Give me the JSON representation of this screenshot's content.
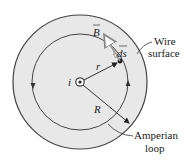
{
  "diagram": {
    "colors": {
      "wire_fill": "#e6e6e6",
      "outline": "#444444",
      "vector_B": "#9a9a9a",
      "background": "#ffffff"
    },
    "center": {
      "x": 80,
      "y": 82
    },
    "wire_radius_px": 67,
    "amperian_radius_px": 48,
    "labels": {
      "current": "i",
      "radius_small": "r",
      "radius_large": "R",
      "field_vector": "B",
      "path_element": "ds",
      "wire_surface_line1": "Wire",
      "wire_surface_line2": "surface",
      "amperian_line1": "Amperian",
      "amperian_line2": "loop"
    },
    "loop_direction": "counterclockwise",
    "current_direction": "out of page"
  }
}
